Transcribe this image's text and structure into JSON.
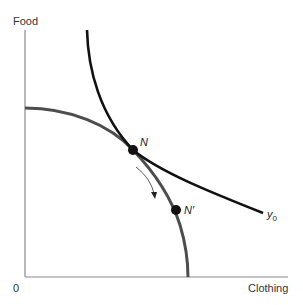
{
  "axes": {
    "y_label": "Food",
    "x_label": "Clothing",
    "origin_label": "0",
    "color": "#808080"
  },
  "curves": {
    "ppf": {
      "name": "production-possibility-frontier",
      "color": "#4d4d4d"
    },
    "indifference": {
      "name": "indifference-curve",
      "label": "y",
      "label_sub": "0",
      "color": "#111111"
    }
  },
  "points": [
    {
      "label": "N",
      "x": 133,
      "y": 150
    },
    {
      "label": "N′",
      "x": 176,
      "y": 210
    }
  ],
  "arrow": {
    "direction": "down-along-frontier",
    "color": "#555555"
  }
}
